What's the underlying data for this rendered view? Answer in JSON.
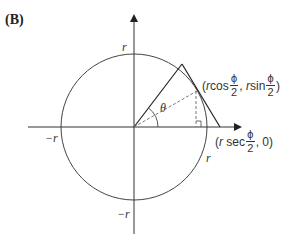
{
  "panel": {
    "label": "(B)"
  },
  "diagram": {
    "type": "unit-circle-tangent-construction",
    "axis_labels": {
      "top": "r",
      "left": "−r",
      "bottom": "−r",
      "right": "r"
    },
    "angle_label": "θ",
    "tangent_point": {
      "open": "(",
      "r1": "r",
      "func1": " cos",
      "num": "ϕ",
      "den": "2",
      "sep": ", ",
      "r2": "r",
      "func2": " sin",
      "close": ")"
    },
    "axis_point": {
      "open": "(",
      "r": "r",
      "func": " sec",
      "num": "ϕ",
      "den": "2",
      "rest": ", 0)"
    },
    "colors": {
      "stroke": "#333333",
      "dashed": "#777777",
      "background": "#ffffff"
    }
  }
}
